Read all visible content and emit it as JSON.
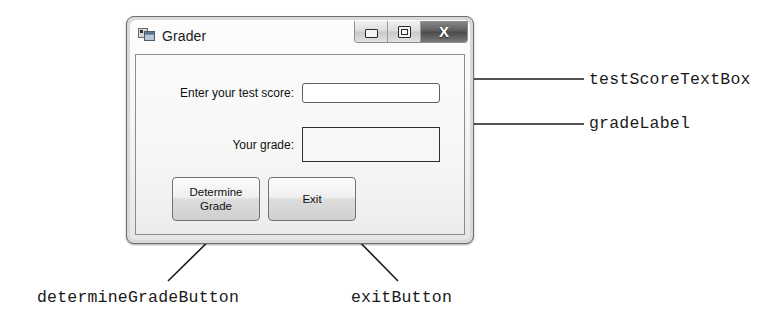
{
  "window": {
    "title": "Grader",
    "icon": "vb-form-icon",
    "controls": [
      {
        "name": "minimize",
        "glyph": "–"
      },
      {
        "name": "maximize",
        "glyph": "□"
      },
      {
        "name": "close",
        "glyph": "X"
      }
    ]
  },
  "form": {
    "score_label": "Enter your test score:",
    "score_value": "",
    "score_placeholder": "",
    "grade_label": "Your grade:",
    "grade_value": "",
    "determine_button": "Determine\nGrade",
    "determine_button_line1": "Determine",
    "determine_button_line2": "Grade",
    "exit_button": "Exit"
  },
  "callouts": {
    "test_score_textbox": "testScoreTextBox",
    "grade_label": "gradeLabel",
    "determine_grade_button": "determineGradeButton",
    "exit_button": "exitButton"
  },
  "colors": {
    "ink": "#1a1a1a",
    "window_frame": "#6e6e6e",
    "close_button": "#5c5c5c",
    "client_bg": "#f6f6f6"
  }
}
